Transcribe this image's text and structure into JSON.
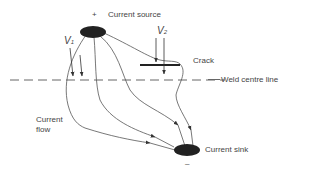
{
  "diagram": {
    "labels": {
      "plus": "+",
      "current_source": "Current source",
      "v1": "V",
      "v1_sub": "1",
      "v2": "V",
      "v2_sub": "2",
      "crack": "Crack",
      "weld_centre_line": "Weld centre line",
      "current_flow_1": "Current",
      "current_flow_2": "flow",
      "current_sink": "Current sink",
      "minus": "–"
    },
    "colors": {
      "line": "#555555",
      "electrode": "#222222",
      "text": "#444444"
    }
  }
}
